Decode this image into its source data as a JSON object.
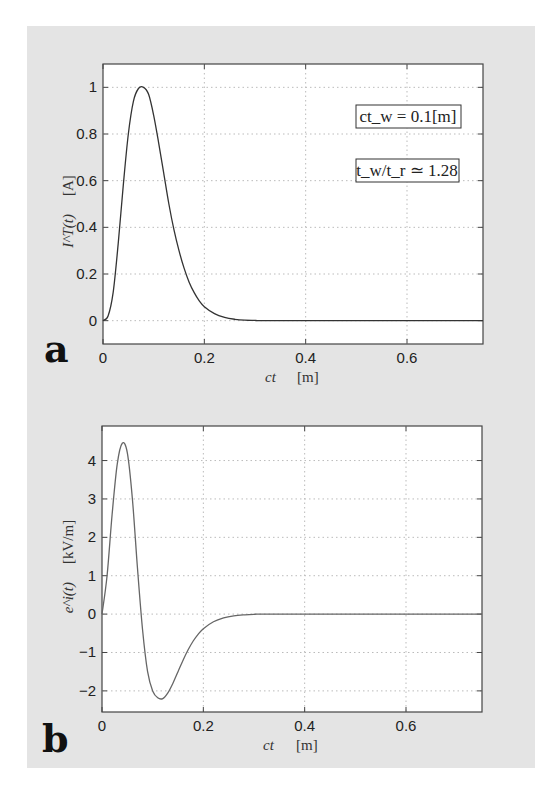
{
  "chart_data": [
    {
      "id": "a",
      "type": "line",
      "panel_label": "a",
      "title": "",
      "xlabel_var": "ct",
      "xlabel_unit": "[m]",
      "ylabel_var": "I^T(t)",
      "ylabel_unit": "[A]",
      "xlim": [
        0,
        0.75
      ],
      "ylim": [
        -0.1,
        1.1
      ],
      "xticks": [
        0,
        0.2,
        0.4,
        0.6
      ],
      "xtick_labels": [
        "0",
        "0.2",
        "0.4",
        "0.6"
      ],
      "yticks": [
        0,
        0.2,
        0.4,
        0.6,
        0.8,
        1
      ],
      "ytick_labels": [
        "0",
        "0.2",
        "0.4",
        "0.6",
        "0.8",
        "1"
      ],
      "grid": true,
      "annotations": [
        "ct_w = 0.1[m]",
        "t_w/t_r ≃ 1.28"
      ],
      "series": [
        {
          "name": "I^T(t)",
          "x": [
            0,
            0.01,
            0.02,
            0.03,
            0.04,
            0.05,
            0.06,
            0.07,
            0.08,
            0.09,
            0.1,
            0.11,
            0.12,
            0.13,
            0.14,
            0.15,
            0.16,
            0.17,
            0.18,
            0.19,
            0.2,
            0.22,
            0.24,
            0.26,
            0.28,
            0.3,
            0.35,
            0.75
          ],
          "y": [
            0,
            0.02,
            0.12,
            0.33,
            0.58,
            0.8,
            0.94,
            0.995,
            1.0,
            0.97,
            0.88,
            0.76,
            0.63,
            0.5,
            0.39,
            0.3,
            0.225,
            0.165,
            0.12,
            0.085,
            0.06,
            0.03,
            0.014,
            0.006,
            0.002,
            0.001,
            0,
            0
          ]
        }
      ]
    },
    {
      "id": "b",
      "type": "line",
      "panel_label": "b",
      "title": "",
      "xlabel_var": "ct",
      "xlabel_unit": "[m]",
      "ylabel_var": "e^i(t)",
      "ylabel_unit": "[kV/m]",
      "xlim": [
        0,
        0.75
      ],
      "ylim": [
        -2.55,
        4.9
      ],
      "xticks": [
        0,
        0.2,
        0.4,
        0.6
      ],
      "xtick_labels": [
        "0",
        "0.2",
        "0.4",
        "0.6"
      ],
      "yticks": [
        -2,
        -1,
        0,
        1,
        2,
        3,
        4
      ],
      "ytick_labels": [
        "−2",
        "−1",
        "0",
        "1",
        "2",
        "3",
        "4"
      ],
      "grid": true,
      "series": [
        {
          "name": "e^i(t)",
          "x": [
            0,
            0.01,
            0.02,
            0.03,
            0.04,
            0.05,
            0.06,
            0.07,
            0.08,
            0.09,
            0.1,
            0.11,
            0.12,
            0.13,
            0.14,
            0.15,
            0.16,
            0.17,
            0.18,
            0.19,
            0.2,
            0.22,
            0.24,
            0.26,
            0.28,
            0.3,
            0.35,
            0.75
          ],
          "y": [
            0,
            1.0,
            2.6,
            3.9,
            4.45,
            4.2,
            3.0,
            1.2,
            -0.4,
            -1.5,
            -2.0,
            -2.18,
            -2.2,
            -2.05,
            -1.8,
            -1.5,
            -1.2,
            -0.93,
            -0.7,
            -0.52,
            -0.38,
            -0.2,
            -0.1,
            -0.045,
            -0.02,
            -0.008,
            0,
            0
          ]
        }
      ]
    }
  ]
}
